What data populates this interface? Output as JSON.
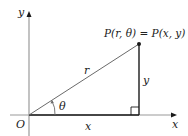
{
  "diagram": {
    "type": "polar-cartesian-relationship",
    "axes": {
      "x_label": "x",
      "y_label": "y",
      "origin_label": "O"
    },
    "point": {
      "label": "P(r, θ) = P(x, y)"
    },
    "segments": {
      "hypotenuse_label": "r",
      "horizontal_leg_label": "x",
      "vertical_leg_label": "y"
    },
    "angle": {
      "label": "θ"
    },
    "colors": {
      "axis": "#9a9a9a",
      "lines": "#1a1a1a",
      "text": "#222222"
    }
  }
}
